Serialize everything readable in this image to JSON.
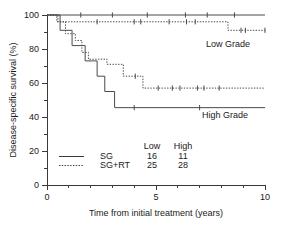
{
  "chart_data": {
    "type": "line",
    "title": "",
    "xlabel": "Time from initial treatment (years)",
    "ylabel": "Disease-specific survival (%)",
    "xlim": [
      0,
      10
    ],
    "ylim": [
      0,
      100
    ],
    "grid": false,
    "x_ticks": [
      0,
      5,
      10
    ],
    "x_tick_labels": [
      "0",
      "5",
      "10"
    ],
    "x_minor_ticks": [
      1,
      2,
      3,
      4,
      6,
      7,
      8,
      9
    ],
    "y_ticks": [
      0,
      20,
      40,
      60,
      80,
      100
    ],
    "y_tick_labels": [
      "0",
      "20",
      "40",
      "60",
      "80",
      "100"
    ],
    "y_minor_ticks": [
      10,
      30,
      50,
      70,
      90
    ],
    "annotations": [
      {
        "text": "Low Grade",
        "x": 8.3,
        "y": 85
      },
      {
        "text": "High Grade",
        "x": 8.3,
        "y": 37
      }
    ],
    "series": [
      {
        "name": "SG Low Grade",
        "style": "solid",
        "group": "Low Grade",
        "n": 16,
        "steps": [
          [
            0,
            100
          ],
          [
            10,
            100
          ]
        ],
        "censor_points": [
          [
            1.55,
            100
          ],
          [
            3.0,
            100
          ],
          [
            4.6,
            100
          ],
          [
            6.35,
            100
          ],
          [
            7.35,
            100
          ],
          [
            8.6,
            100
          ]
        ]
      },
      {
        "name": "SG+RT Low Grade",
        "style": "dotted",
        "group": "Low Grade",
        "n": 25,
        "steps": [
          [
            0,
            100
          ],
          [
            0.45,
            100
          ],
          [
            0.45,
            96.0
          ],
          [
            8.3,
            96.0
          ],
          [
            8.3,
            91.0
          ],
          [
            10,
            91.0
          ]
        ],
        "censor_points": [
          [
            2.3,
            96.0
          ],
          [
            4.0,
            96.0
          ],
          [
            4.3,
            96.0
          ],
          [
            5.6,
            96.0
          ],
          [
            6.4,
            96.0
          ],
          [
            6.8,
            96.0
          ],
          [
            8.9,
            91.0
          ],
          [
            9.1,
            91.0
          ],
          [
            10.0,
            91.0
          ]
        ]
      },
      {
        "name": "SG High Grade",
        "style": "solid",
        "group": "High Grade",
        "n": 11,
        "steps": [
          [
            0,
            100
          ],
          [
            0.6,
            100
          ],
          [
            0.6,
            91.0
          ],
          [
            1.15,
            91.0
          ],
          [
            1.15,
            82.0
          ],
          [
            1.75,
            82.0
          ],
          [
            1.75,
            73.0
          ],
          [
            2.3,
            73.0
          ],
          [
            2.3,
            64.0
          ],
          [
            2.65,
            64.0
          ],
          [
            2.65,
            55.0
          ],
          [
            3.1,
            55.0
          ],
          [
            3.1,
            45.5
          ],
          [
            10,
            45.5
          ]
        ],
        "censor_points": [
          [
            4.0,
            45.5
          ],
          [
            7.0,
            45.5
          ]
        ]
      },
      {
        "name": "SG+RT High Grade",
        "style": "dotted",
        "group": "High Grade",
        "n": 28,
        "steps": [
          [
            0,
            100
          ],
          [
            0.5,
            100
          ],
          [
            0.5,
            96.0
          ],
          [
            0.85,
            96.0
          ],
          [
            0.85,
            89.0
          ],
          [
            1.3,
            89.0
          ],
          [
            1.3,
            85.0
          ],
          [
            1.6,
            85.0
          ],
          [
            1.6,
            78.0
          ],
          [
            1.9,
            78.0
          ],
          [
            1.9,
            74.0
          ],
          [
            2.75,
            74.0
          ],
          [
            2.75,
            71.0
          ],
          [
            3.5,
            71.0
          ],
          [
            3.5,
            64.0
          ],
          [
            4.4,
            64.0
          ],
          [
            4.4,
            57.0
          ],
          [
            10,
            57.0
          ]
        ],
        "censor_points": [
          [
            4.05,
            64.0
          ],
          [
            5.1,
            57.0
          ],
          [
            5.75,
            57.0
          ],
          [
            6.1,
            57.0
          ],
          [
            6.9,
            57.0
          ],
          [
            7.2,
            57.0
          ],
          [
            7.9,
            57.0
          ]
        ]
      }
    ],
    "legend": {
      "position": "inside-bottom-left",
      "column_headers": [
        "",
        "Low",
        "High"
      ],
      "rows": [
        {
          "label": "SG",
          "style": "solid",
          "low": "16",
          "high": "11"
        },
        {
          "label": "SG+RT",
          "style": "dotted",
          "low": "25",
          "high": "28"
        }
      ]
    }
  }
}
